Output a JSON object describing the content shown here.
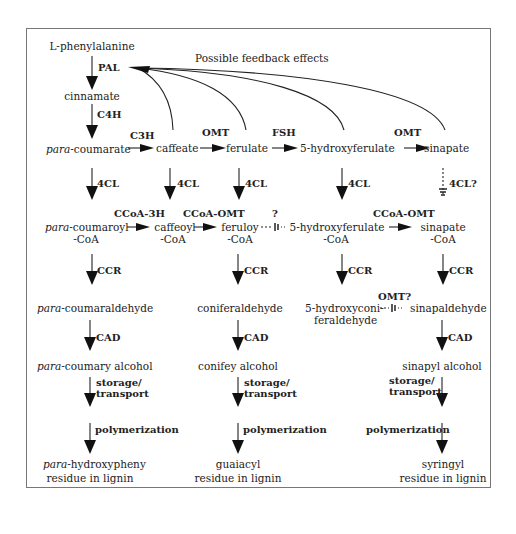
{
  "diagram": {
    "title_note": "Possible feedback effects",
    "compounds": {
      "phenylalanine": "L-phenylalanine",
      "cinnamate": "cinnamate",
      "coumarate_prefix": "para",
      "coumarate_suffix": "-coumarate",
      "caffeate": "caffeate",
      "ferulate": "ferulate",
      "hydroxyferulate": "5-hydroxyferulate",
      "sinapate": "sinapate",
      "coumaroyl_prefix": "para",
      "coumaroyl_suffix": "-coumaroyl",
      "coumaroyl_line2": "-CoA",
      "caffeoyl": "caffeoyl",
      "caffeoyl_line2": "-CoA",
      "feruloy": "feruloy",
      "feruloy_line2": "-CoA",
      "hydroxyferulate_coa": "5-hydroxyferulate",
      "hydroxyferulate_coa_line2": "-CoA",
      "sinapate_coa": "sinapate",
      "sinapate_coa_line2": "-CoA",
      "coumaraldehyde_prefix": "para",
      "coumaraldehyde_suffix": "-coumaraldehyde",
      "coniferaldehyde": "coniferaldehyde",
      "hydroxyconiferaldehyde": "5-hydroxyconi-",
      "hydroxyconiferaldehyde_line2": "feraldehyde",
      "sinapaldehyde": "sinapaldehyde",
      "coumaryl_alcohol_prefix": "para",
      "coumaryl_alcohol_suffix": "-coumary alcohol",
      "coniferyl_alcohol": "conifey alcohol",
      "sinapyl_alcohol": "sinapyl alcohol",
      "hydroxyphenyl_prefix": "para",
      "hydroxyphenyl_suffix": "-hydroxypheny",
      "hydroxyphenyl_line2": "residue in lignin",
      "guaiacyl": "guaiacyl",
      "guaiacyl_line2": "residue in lignin",
      "syringyl": "syringyl",
      "syringyl_line2": "residue in lignin"
    },
    "enzymes": {
      "pal": "PAL",
      "c4h": "C4H",
      "c3h": "C3H",
      "omt1": "OMT",
      "fsh": "FSH",
      "omt2": "OMT",
      "cl1": "4CL",
      "cl2": "4CL",
      "cl3": "4CL",
      "cl4": "4CL",
      "cl5": "4CL?",
      "ccoa3h": "CCoA-3H",
      "ccoaomt1": "CCoA-OMT",
      "unknown": "?",
      "ccoaomt2": "CCoA-OMT",
      "ccr1": "CCR",
      "ccr2": "CCR",
      "ccr3": "CCR",
      "ccr4": "CCR",
      "omt3": "OMT?",
      "cad1": "CAD",
      "cad2": "CAD",
      "cad3": "CAD",
      "storage1": "storage/",
      "transport1": "transport",
      "storage2": "storage/",
      "transport2": "transport",
      "storage3": "storage/",
      "transport3": "transport",
      "poly1": "polymerization",
      "poly2": "polymerization",
      "poly3": "polymerization"
    }
  }
}
